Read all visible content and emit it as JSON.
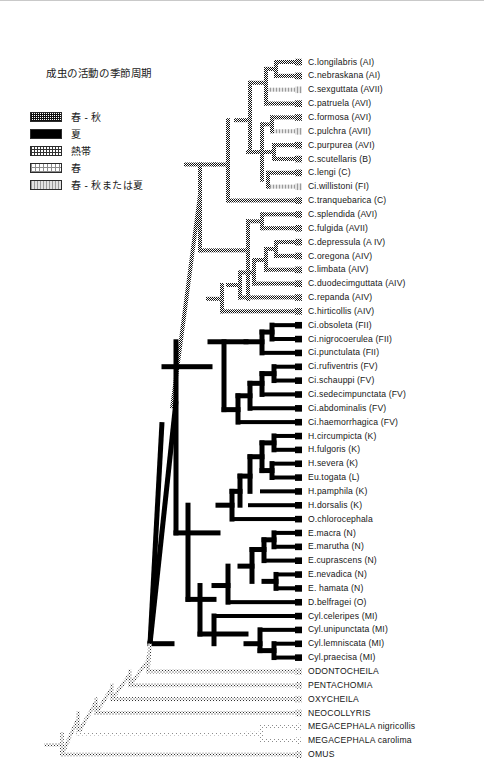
{
  "figure": {
    "width": 484,
    "height": 775,
    "background": "#ffffff",
    "border_color": "#c9c9c9"
  },
  "legend": {
    "title": "成虫の活動の季節周期",
    "items": [
      {
        "key": "spring_autumn",
        "label": "春 - 秋",
        "pattern": "checker-dark",
        "color": "#111111"
      },
      {
        "key": "summer",
        "label": "夏",
        "pattern": "solid-black",
        "color": "#000000"
      },
      {
        "key": "tropical",
        "label": "熱帯",
        "pattern": "dotted-medium",
        "color": "#333333"
      },
      {
        "key": "spring",
        "label": "春",
        "pattern": "dotted-light",
        "color": "#8c8c8c"
      },
      {
        "key": "mixed",
        "label": "春 - 秋または夏",
        "pattern": "vertical-gray",
        "color": "#9a9a9a"
      }
    ]
  },
  "chart_data": {
    "type": "diagram",
    "subtype": "cladogram",
    "title": "成虫の活動の季節周期",
    "n_tips": 49,
    "row_spacing": 13.85,
    "first_row_y": 61,
    "root_x": 46,
    "tip_x": 296,
    "label_x": 308,
    "states": [
      "spring_autumn",
      "summer",
      "tropical",
      "spring",
      "mixed"
    ],
    "tips": [
      {
        "name": "C.longilabris (AI)",
        "state": "spring_autumn",
        "branch_x": 276
      },
      {
        "name": "C.nebraskana (AI)",
        "state": "spring_autumn",
        "branch_x": 276
      },
      {
        "name": "C.sexguttata (AVII)",
        "state": "mixed",
        "branch_x": 266
      },
      {
        "name": "C.patruela (AVI)",
        "state": "spring_autumn",
        "branch_x": 266
      },
      {
        "name": "C.formosa (AVI)",
        "state": "spring_autumn",
        "branch_x": 272
      },
      {
        "name": "C.pulchra (AVII)",
        "state": "mixed",
        "branch_x": 272
      },
      {
        "name": "C.purpurea (AVI)",
        "state": "spring_autumn",
        "branch_x": 274
      },
      {
        "name": "C.scutellaris (B)",
        "state": "spring_autumn",
        "branch_x": 274
      },
      {
        "name": "C.lengi (C)",
        "state": "spring_autumn",
        "branch_x": 268
      },
      {
        "name": "Ci.willistoni (FI)",
        "state": "mixed",
        "branch_x": 268
      },
      {
        "name": "C.tranquebarica (C)",
        "state": "spring_autumn",
        "branch_x": 228
      },
      {
        "name": "C.splendida (AVI)",
        "state": "spring_autumn",
        "branch_x": 262
      },
      {
        "name": "C.fulgida (AVII)",
        "state": "spring_autumn",
        "branch_x": 262
      },
      {
        "name": "C.depressula (A IV)",
        "state": "spring_autumn",
        "branch_x": 276
      },
      {
        "name": "C.oregona (AIV)",
        "state": "spring_autumn",
        "branch_x": 276
      },
      {
        "name": "C.limbata (AIV)",
        "state": "spring_autumn",
        "branch_x": 266
      },
      {
        "name": "C.duodecimguttata (AIV)",
        "state": "spring_autumn",
        "branch_x": 254
      },
      {
        "name": "C.repanda (AIV)",
        "state": "spring_autumn",
        "branch_x": 240
      },
      {
        "name": "C.hirticollis (AIV)",
        "state": "spring_autumn",
        "branch_x": 222
      },
      {
        "name": "Ci.obsoleta (FII)",
        "state": "summer",
        "branch_x": 272
      },
      {
        "name": "Ci.nigrocoerulea (FII)",
        "state": "summer",
        "branch_x": 272
      },
      {
        "name": "Ci.punctulata (FII)",
        "state": "summer",
        "branch_x": 262
      },
      {
        "name": "Ci.rufiventris (FV)",
        "state": "summer",
        "branch_x": 274
      },
      {
        "name": "Ci.schauppi (FV)",
        "state": "summer",
        "branch_x": 274
      },
      {
        "name": "Ci.sedecimpunctata (FV)",
        "state": "summer",
        "branch_x": 262
      },
      {
        "name": "Ci.abdominalis (FV)",
        "state": "summer",
        "branch_x": 250
      },
      {
        "name": "Ci.haemorrhagica (FV)",
        "state": "summer",
        "branch_x": 238
      },
      {
        "name": "H.circumpicta (K)",
        "state": "summer",
        "branch_x": 274
      },
      {
        "name": "H.fulgoris (K)",
        "state": "summer",
        "branch_x": 274
      },
      {
        "name": "H.severa (K)",
        "state": "summer",
        "branch_x": 272
      },
      {
        "name": "Eu.togata (L)",
        "state": "summer",
        "branch_x": 272
      },
      {
        "name": "H.pamphila (K)",
        "state": "summer",
        "branch_x": 262
      },
      {
        "name": "H.dorsalis (K)",
        "state": "summer",
        "branch_x": 250
      },
      {
        "name": "O.chlorocephala",
        "state": "summer",
        "branch_x": 232
      },
      {
        "name": "E.macra (N)",
        "state": "summer",
        "branch_x": 274
      },
      {
        "name": "E.marutha (N)",
        "state": "summer",
        "branch_x": 274
      },
      {
        "name": "E.cuprascens (N)",
        "state": "summer",
        "branch_x": 264
      },
      {
        "name": "E.nevadica (N)",
        "state": "summer",
        "branch_x": 276
      },
      {
        "name": "E. hamata (N)",
        "state": "summer",
        "branch_x": 276
      },
      {
        "name": "D.belfragei (O)",
        "state": "summer",
        "branch_x": 228
      },
      {
        "name": "Cyl.celeripes (MI)",
        "state": "summer",
        "branch_x": 214
      },
      {
        "name": "Cyl.unipunctata (MI)",
        "state": "summer",
        "branch_x": 260
      },
      {
        "name": "Cyl.lemniscata (MI)",
        "state": "summer",
        "branch_x": 274
      },
      {
        "name": "Cyl.praecisa (MI)",
        "state": "summer",
        "branch_x": 274
      },
      {
        "name": "ODONTOCHEILA",
        "state": "tropical",
        "branch_x": 148
      },
      {
        "name": "PENTACHOMIA",
        "state": "tropical",
        "branch_x": 130
      },
      {
        "name": "OXYCHEILA",
        "state": "tropical",
        "branch_x": 112
      },
      {
        "name": "NEOCOLLYRIS",
        "state": "tropical",
        "branch_x": 96
      },
      {
        "name": "MEGACEPHALA nigricollis",
        "state": "spring",
        "branch_x": 262
      },
      {
        "name": "MEGACEPHALA carolima",
        "state": "spring",
        "branch_x": 262
      },
      {
        "name": "OMUS",
        "state": "tropical",
        "branch_x": 62
      }
    ]
  }
}
